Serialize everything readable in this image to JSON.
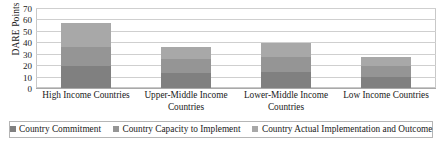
{
  "chart_data": {
    "type": "bar",
    "subtype": "stacked-column",
    "title": "",
    "xlabel": "",
    "ylabel": "DARE Points",
    "ylim": [
      0,
      70
    ],
    "ytick_step": 10,
    "yticks": [
      70,
      60,
      50,
      40,
      30,
      20,
      10,
      0
    ],
    "grid": true,
    "legend_position": "bottom",
    "categories": [
      "High Income Countries",
      "Upper-Middle Income Countries",
      "Lower-Middle Income Countries",
      "Low Income Countries"
    ],
    "series": [
      {
        "name": "Country Commitment",
        "color": "#808080",
        "values": [
          19,
          13,
          14,
          10
        ]
      },
      {
        "name": "Country Capacity to Implement",
        "color": "#959595",
        "values": [
          17,
          12,
          13,
          9
        ]
      },
      {
        "name": "Country Actual Implementation and Outcome",
        "color": "#a8a8a8",
        "values": [
          21,
          11,
          12,
          8
        ]
      }
    ],
    "totals": [
      57,
      36,
      39,
      27
    ]
  },
  "axis": {
    "y_title": "DARE Points"
  },
  "legend": {
    "items": [
      {
        "label": "Country Commitment",
        "color": "#808080"
      },
      {
        "label": "Country Capacity to Implement",
        "color": "#959595"
      },
      {
        "label": "Country Actual Implementation and Outcome",
        "color": "#a8a8a8"
      }
    ]
  }
}
